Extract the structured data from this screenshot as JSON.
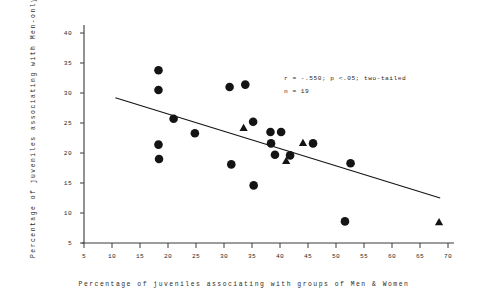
{
  "chart_data": {
    "type": "scatter",
    "title": "",
    "xlabel": "Percentage of juveniles associating with groups of Men & Women",
    "ylabel": "Percentage of juveniles associating with Men-only groups",
    "xlim": [
      5,
      70
    ],
    "ylim": [
      5,
      40
    ],
    "xticks": [
      5,
      10,
      15,
      20,
      25,
      30,
      35,
      40,
      45,
      50,
      55,
      60,
      65,
      70
    ],
    "yticks": [
      5,
      10,
      15,
      20,
      25,
      30,
      35,
      40
    ],
    "grid": false,
    "legend": "none",
    "annotations": {
      "line1": "r = -.550;  p <.05; two-tailed",
      "line2": "n = 19"
    },
    "series": [
      {
        "name": "circles",
        "marker": "circle",
        "color": "#141414",
        "points": [
          {
            "x": 18.3,
            "y": 33.8
          },
          {
            "x": 18.3,
            "y": 30.5
          },
          {
            "x": 18.3,
            "y": 21.4
          },
          {
            "x": 18.4,
            "y": 19.0
          },
          {
            "x": 21.0,
            "y": 25.7
          },
          {
            "x": 24.8,
            "y": 23.3
          },
          {
            "x": 31.0,
            "y": 31.0
          },
          {
            "x": 31.3,
            "y": 18.1
          },
          {
            "x": 33.8,
            "y": 31.4
          },
          {
            "x": 35.2,
            "y": 25.2
          },
          {
            "x": 35.3,
            "y": 14.6
          },
          {
            "x": 38.3,
            "y": 23.5
          },
          {
            "x": 38.4,
            "y": 21.6
          },
          {
            "x": 40.2,
            "y": 23.5
          },
          {
            "x": 39.1,
            "y": 19.7
          },
          {
            "x": 41.8,
            "y": 19.6
          },
          {
            "x": 45.9,
            "y": 21.6
          },
          {
            "x": 52.6,
            "y": 18.3
          },
          {
            "x": 51.6,
            "y": 8.6
          }
        ]
      },
      {
        "name": "triangles",
        "marker": "triangle",
        "color": "#141414",
        "points": [
          {
            "x": 33.5,
            "y": 24.2
          },
          {
            "x": 44.1,
            "y": 21.7
          },
          {
            "x": 41.1,
            "y": 18.7
          },
          {
            "x": 68.4,
            "y": 8.5
          }
        ]
      }
    ],
    "trendline": {
      "name": "regression-line",
      "color": "#141414",
      "x0": 10.6,
      "y0": 29.2,
      "x1": 68.6,
      "y1": 12.5
    }
  }
}
